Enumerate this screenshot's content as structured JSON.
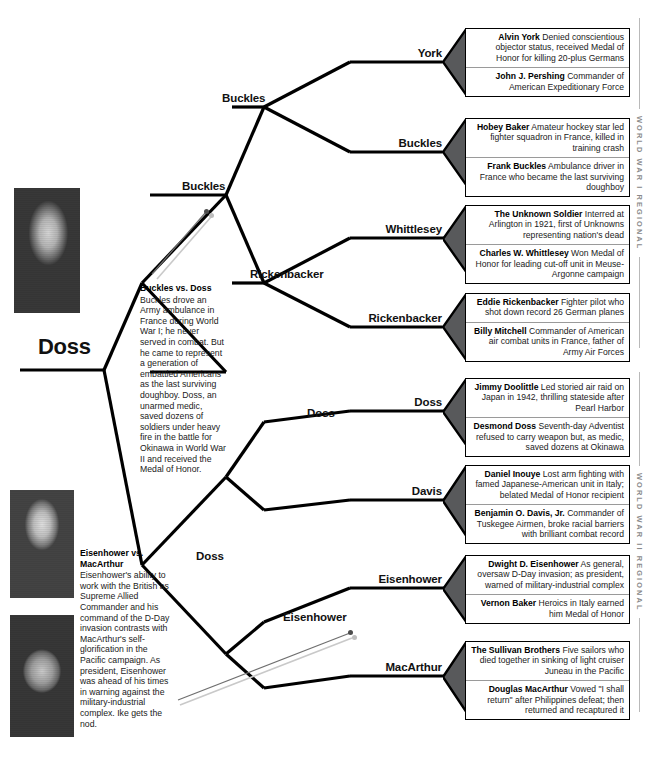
{
  "champion": {
    "label": "Doss"
  },
  "rails": [
    {
      "name": "world-war-i-regional",
      "text": "WORLD WAR I REGIONAL"
    },
    {
      "name": "world-war-ii-regional",
      "text": "WORLD WAR II REGIONAL"
    }
  ],
  "round_labels": {
    "semifinal_top": "Buckles",
    "semifinal_bottom": "Doss",
    "quarter_1": "Buckles",
    "quarter_2": "Rickenbacker",
    "quarter_3": "Doss",
    "quarter_4": "Eisenhower",
    "round1_1": "York",
    "round1_2": "Buckles",
    "round1_3": "Whittlesey",
    "round1_4": "Rickenbacker",
    "round1_5": "Doss",
    "round1_6": "Davis",
    "round1_7": "Eisenhower",
    "round1_8": "MacArthur"
  },
  "matchups": [
    {
      "name": "matchup-york-pershing",
      "winner": "York",
      "entries": [
        {
          "person": "Alvin York",
          "desc": " Denied conscientious objector status, received Medal of Honor for killing 20-plus Germans"
        },
        {
          "person": "John J. Pershing",
          "desc": " Commander of American Expeditionary Force"
        }
      ]
    },
    {
      "name": "matchup-baker-buckles",
      "winner": "Buckles",
      "entries": [
        {
          "person": "Hobey Baker",
          "desc": " Amateur hockey star led fighter squadron in France, killed in training crash"
        },
        {
          "person": "Frank Buckles",
          "desc": " Ambulance driver in France who became the last surviving doughboy"
        }
      ]
    },
    {
      "name": "matchup-unknown-whittlesey",
      "winner": "Whittlesey",
      "entries": [
        {
          "person": "The Unknown Soldier",
          "desc": " Interred at Arlington in 1921, first of Unknowns representing nation's dead"
        },
        {
          "person": "Charles W. Whittlesey",
          "desc": " Won Medal of Honor for leading cut-off unit in Meuse-Argonne campaign"
        }
      ]
    },
    {
      "name": "matchup-rickenbacker-mitchell",
      "winner": "Rickenbacker",
      "entries": [
        {
          "person": "Eddie Rickenbacker",
          "desc": " Fighter pilot who shot down record 26 German planes"
        },
        {
          "person": "Billy Mitchell",
          "desc": " Commander of American air combat units in France, father of Army Air Forces"
        }
      ]
    },
    {
      "name": "matchup-doolittle-doss",
      "winner": "Doss",
      "entries": [
        {
          "person": "Jimmy Doolittle",
          "desc": " Led storied air raid on Japan in 1942, thrilling stateside after Pearl Harbor"
        },
        {
          "person": "Desmond Doss",
          "desc": " Seventh-day Adventist refused to carry weapon but, as medic, saved dozens at Okinawa"
        }
      ]
    },
    {
      "name": "matchup-inouye-davis",
      "winner": "Davis",
      "entries": [
        {
          "person": "Daniel Inouye",
          "desc": " Lost arm fighting with famed Japanese-American unit in Italy; belated Medal of Honor recipient"
        },
        {
          "person": "Benjamin O. Davis, Jr.",
          "desc": " Commander of Tuskegee Airmen, broke racial barriers with brilliant combat record"
        }
      ]
    },
    {
      "name": "matchup-eisenhower-baker",
      "winner": "Eisenhower",
      "entries": [
        {
          "person": "Dwight D. Eisenhower",
          "desc": " As general, oversaw D-Day invasion; as president, warned of military-industrial complex"
        },
        {
          "person": "Vernon Baker",
          "desc": " Heroics in Italy earned him Medal of Honor"
        }
      ]
    },
    {
      "name": "matchup-sullivans-macarthur",
      "winner": "MacArthur",
      "entries": [
        {
          "person": "The Sullivan Brothers",
          "desc": " Five sailors who died together in sinking of light cruiser Juneau in the Pacific"
        },
        {
          "person": "Douglas MacArthur",
          "desc": " Vowed \"I shall return\" after Philippines defeat; then returned and recaptured it"
        }
      ]
    }
  ],
  "notes": [
    {
      "name": "note-buckles-vs-doss",
      "title": "Buckles vs. Doss",
      "body": "Buckles drove an Army ambulance in France during World War I; he never served in combat. But he came to represent a generation of embattled Americans as the last surviving doughboy. Doss, an unarmed medic, saved dozens of soldiers under heavy fire in the battle for Okinawa in World War II and received the Medal of Honor."
    },
    {
      "name": "note-eisenhower-vs-macarthur",
      "title": "Eisenhower vs. MacArthur",
      "body": "Eisenhower's ability to work with the British as Supreme Allied Commander and his command of the D-Day invasion contrasts with MacArthur's self-glorification in the Pacific campaign. As president, Eisenhower was ahead of his times in warning against the military-industrial complex. Ike gets the nod."
    }
  ],
  "photos": [
    {
      "name": "photo-desmond-doss",
      "caption": "Desmond Doss portrait"
    },
    {
      "name": "photo-dwight-eisenhower",
      "caption": "Dwight D. Eisenhower portrait"
    },
    {
      "name": "photo-douglas-macarthur",
      "caption": "Douglas MacArthur portrait"
    }
  ],
  "colors": {
    "chevron": "#58595b",
    "line": "#000000",
    "rail_text": "#8a8a8a",
    "divider": "#9a9a9a"
  }
}
